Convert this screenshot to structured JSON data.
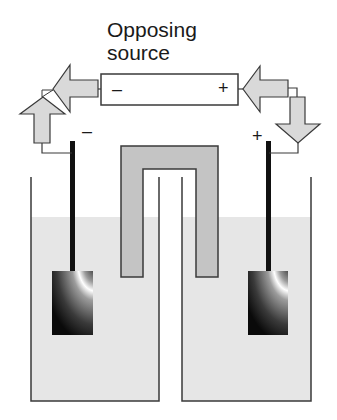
{
  "diagram": {
    "title_line1": "Opposing",
    "title_line2": "source",
    "battery": {
      "negative_terminal": "–",
      "positive_terminal": "+"
    },
    "electrodes": {
      "left_sign": "–",
      "right_sign": "+"
    },
    "components": [
      "opposing-source-battery",
      "current-arrows",
      "left-half-cell",
      "right-half-cell",
      "salt-bridge",
      "electrodes"
    ],
    "colors": {
      "line": "#3a3a3a",
      "arrow_fill": "#d9d9d9",
      "solution_fill": "#e6e6e6",
      "salt_bridge_fill": "#c4c4c4",
      "electrode_rod": "#111111"
    }
  }
}
